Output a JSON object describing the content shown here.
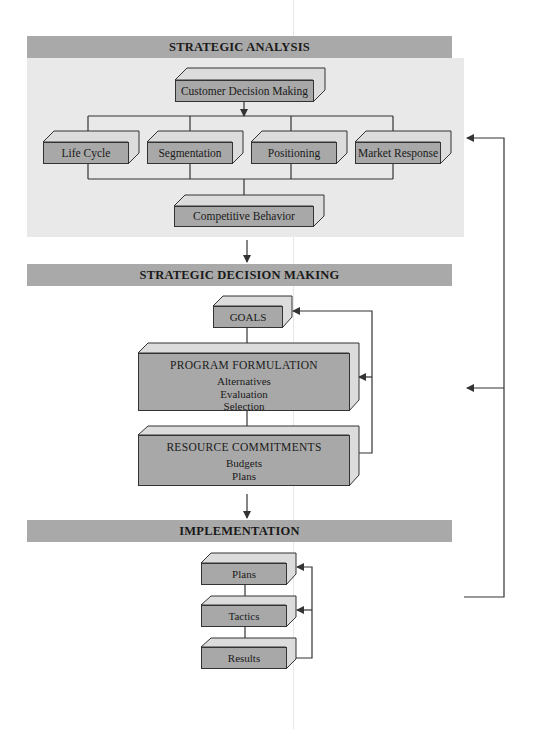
{
  "sections": {
    "strategic_analysis": {
      "header": "STRATEGIC ANALYSIS",
      "top_box": "Customer Decision Making",
      "factors": [
        "Life Cycle",
        "Segmentation",
        "Positioning",
        "Market Response"
      ],
      "bottom_box": "Competitive Behavior"
    },
    "strategic_decision_making": {
      "header": "STRATEGIC DECISION MAKING",
      "goals": "GOALS",
      "program_formulation": {
        "title": "PROGRAM FORMULATION",
        "items": [
          "Alternatives",
          "Evaluation",
          "Selection"
        ]
      },
      "resource_commitments": {
        "title": "RESOURCE COMMITMENTS",
        "items": [
          "Budgets",
          "Plans"
        ]
      }
    },
    "implementation": {
      "header": "IMPLEMENTATION",
      "steps": [
        "Plans",
        "Tactics",
        "Results"
      ]
    }
  },
  "colors": {
    "header_bg": "#a9a9a9",
    "panel_bg": "#e9e9e9",
    "box_front": "#a8a8a8",
    "box_top": "#dcdcdc",
    "line": "#333333"
  }
}
